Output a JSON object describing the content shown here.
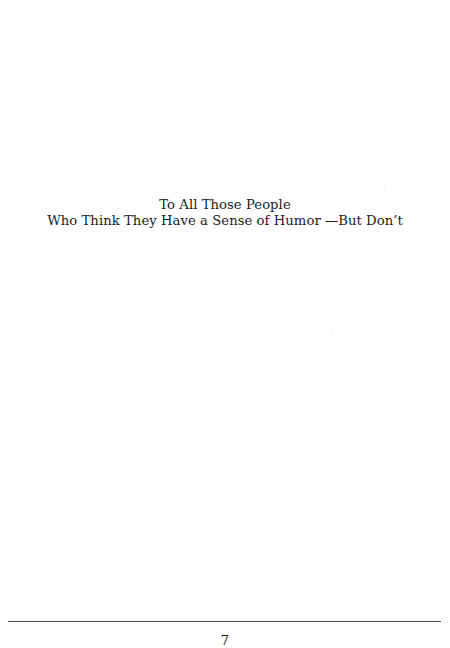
{
  "document": {
    "type": "book-page",
    "section": "dedication",
    "dedication": {
      "lines": [
        "To All Those People",
        "Who Think They Have a Sense of Humor —But Don’t"
      ]
    },
    "footer": {
      "has_rule": true,
      "page_number": "7"
    },
    "colors": {
      "background": "#fefefe",
      "text": "#1c1c1c",
      "rule": "#4a4a4a"
    }
  }
}
